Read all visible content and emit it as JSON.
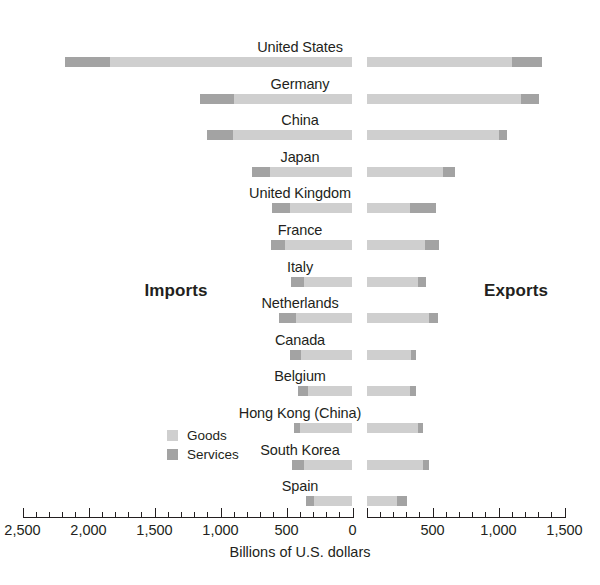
{
  "chart_data": {
    "type": "bar",
    "subtype": "diverging-stacked-bar",
    "title": "",
    "xlabel": "Billions of U.S. dollars",
    "ylabel": "",
    "left_caption": "Imports",
    "right_caption": "Exports",
    "grid": false,
    "legend_position": "inside-left",
    "legend": [
      {
        "name": "Goods",
        "color": "#cfcfcf"
      },
      {
        "name": "Services",
        "color": "#a3a3a3"
      }
    ],
    "axis": {
      "left_range": [
        2500,
        0
      ],
      "right_range": [
        0,
        1500
      ],
      "major_ticks_left": [
        2500,
        2000,
        1500,
        1000,
        500,
        0
      ],
      "major_ticks_right": [
        0,
        500,
        1000,
        1500
      ],
      "minor_tick_step": 100,
      "tick_labels_left": [
        "2,500",
        "2,000",
        "1,500",
        "1,000",
        "500",
        "0"
      ],
      "tick_labels_right": [
        "0",
        "500",
        "1,000",
        "1,500"
      ],
      "units": "Billions of U.S. dollars",
      "split_at_zero": true
    },
    "categories": [
      "United States",
      "Germany",
      "China",
      "Japan",
      "United Kingdom",
      "France",
      "Italy",
      "Netherlands",
      "Canada",
      "Belgium",
      "Hong Kong (China)",
      "South Korea",
      "Spain"
    ],
    "series": [
      {
        "name": "Imports Goods",
        "side": "imports",
        "component": "goods",
        "color": "#cfcfcf",
        "values": [
          1835,
          900,
          905,
          625,
          475,
          510,
          370,
          425,
          390,
          335,
          395,
          370,
          290
        ]
      },
      {
        "name": "Imports Services",
        "side": "imports",
        "component": "services",
        "color": "#a3a3a3",
        "values": [
          340,
          255,
          200,
          135,
          135,
          110,
          95,
          130,
          80,
          75,
          50,
          90,
          60
        ]
      },
      {
        "name": "Exports Goods",
        "side": "exports",
        "component": "goods",
        "color": "#cfcfcf",
        "values": [
          1100,
          1170,
          1000,
          580,
          330,
          440,
          390,
          470,
          340,
          330,
          390,
          425,
          230
        ]
      },
      {
        "name": "Exports Services",
        "side": "exports",
        "component": "services",
        "color": "#a3a3a3",
        "values": [
          230,
          140,
          65,
          90,
          200,
          110,
          60,
          70,
          35,
          45,
          40,
          45,
          80
        ]
      }
    ],
    "rows": [
      {
        "label": "United States",
        "imports_services": 340,
        "imports_goods": 1835,
        "exports_goods": 1100,
        "exports_services": 230
      },
      {
        "label": "Germany",
        "imports_services": 255,
        "imports_goods": 900,
        "exports_goods": 1170,
        "exports_services": 140
      },
      {
        "label": "China",
        "imports_services": 200,
        "imports_goods": 905,
        "exports_goods": 1000,
        "exports_services": 65
      },
      {
        "label": "Japan",
        "imports_services": 135,
        "imports_goods": 625,
        "exports_goods": 580,
        "exports_services": 90
      },
      {
        "label": "United Kingdom",
        "imports_services": 135,
        "imports_goods": 475,
        "exports_goods": 330,
        "exports_services": 200
      },
      {
        "label": "France",
        "imports_services": 110,
        "imports_goods": 510,
        "exports_goods": 440,
        "exports_services": 110
      },
      {
        "label": "Italy",
        "imports_services": 95,
        "imports_goods": 370,
        "exports_goods": 390,
        "exports_services": 60
      },
      {
        "label": "Netherlands",
        "imports_services": 130,
        "imports_goods": 425,
        "exports_goods": 470,
        "exports_services": 70
      },
      {
        "label": "Canada",
        "imports_services": 80,
        "imports_goods": 390,
        "exports_goods": 340,
        "exports_services": 35
      },
      {
        "label": "Belgium",
        "imports_services": 75,
        "imports_goods": 335,
        "exports_goods": 330,
        "exports_services": 45
      },
      {
        "label": "Hong Kong (China)",
        "imports_services": 50,
        "imports_goods": 395,
        "exports_goods": 390,
        "exports_services": 40
      },
      {
        "label": "South Korea",
        "imports_services": 90,
        "imports_goods": 370,
        "exports_goods": 425,
        "exports_services": 45
      },
      {
        "label": "Spain",
        "imports_services": 60,
        "imports_goods": 290,
        "exports_goods": 230,
        "exports_services": 80
      }
    ]
  }
}
